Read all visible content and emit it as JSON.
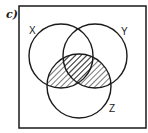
{
  "figure": {
    "part_label": "c)",
    "universe": {
      "x": 19,
      "y": 6,
      "width": 127,
      "height": 122
    },
    "sets": [
      {
        "name": "X",
        "label": "X",
        "cx": 61,
        "cy": 56,
        "r": 32,
        "label_x": 30,
        "label_y": 33
      },
      {
        "name": "Y",
        "label": "Y",
        "cx": 95,
        "cy": 56,
        "r": 32,
        "label_x": 121,
        "label_y": 35
      },
      {
        "name": "Z",
        "label": "Z",
        "cx": 79,
        "cy": 86,
        "r": 32,
        "label_x": 109,
        "label_y": 112
      }
    ],
    "shaded_region": "Z ∩ (X ∪ Y)",
    "shading_style": "diagonal hatch",
    "stroke_color": "#1a1a1a",
    "background_color": "#ffffff"
  }
}
